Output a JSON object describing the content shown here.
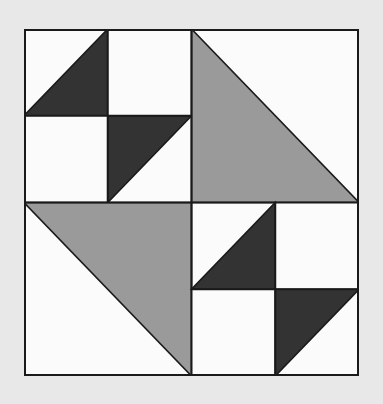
{
  "figure": {
    "kind": "quilt-block-pattern",
    "canvas": {
      "width": 383,
      "height": 404
    },
    "background_color": "#e8e8e8",
    "block": {
      "x": 24,
      "y": 29,
      "width": 335,
      "height": 347,
      "outline_color": "#1a1a1a",
      "outline_width": 2
    },
    "palette": {
      "background": "#e8e8e8",
      "white": "#fbfbfb",
      "gray": "#9a9a9a",
      "dark": "#333333",
      "line": "#1a1a1a"
    },
    "grid": {
      "rows": 2,
      "cols": 2,
      "divider_color": "#1a1a1a",
      "divider_width": 2
    },
    "quadrants": [
      {
        "name": "top-left",
        "row": 0,
        "col": 0,
        "layout": "four-patch",
        "cells": [
          {
            "row": 0,
            "col": 0,
            "fill": "dark",
            "shape": "triangle-bottom-right",
            "color": "#333333"
          },
          {
            "row": 0,
            "col": 1,
            "fill": "white",
            "shape": "square",
            "color": "#fbfbfb"
          },
          {
            "row": 1,
            "col": 0,
            "fill": "white",
            "shape": "square",
            "color": "#fbfbfb"
          },
          {
            "row": 1,
            "col": 1,
            "fill": "dark",
            "shape": "triangle-top-left",
            "color": "#333333"
          }
        ]
      },
      {
        "name": "top-right",
        "row": 0,
        "col": 1,
        "layout": "half-square-triangle",
        "cells": [
          {
            "row": 0,
            "col": 0,
            "fill": "gray",
            "shape": "triangle-bottom-left",
            "color": "#9a9a9a"
          }
        ]
      },
      {
        "name": "bottom-left",
        "row": 1,
        "col": 0,
        "layout": "half-square-triangle",
        "cells": [
          {
            "row": 0,
            "col": 0,
            "fill": "gray",
            "shape": "triangle-top-right",
            "color": "#9a9a9a"
          }
        ]
      },
      {
        "name": "bottom-right",
        "row": 1,
        "col": 1,
        "layout": "four-patch",
        "cells": [
          {
            "row": 0,
            "col": 0,
            "fill": "dark",
            "shape": "triangle-bottom-right",
            "color": "#333333"
          },
          {
            "row": 0,
            "col": 1,
            "fill": "white",
            "shape": "square",
            "color": "#fbfbfb"
          },
          {
            "row": 1,
            "col": 0,
            "fill": "white",
            "shape": "square",
            "color": "#fbfbfb"
          },
          {
            "row": 1,
            "col": 1,
            "fill": "dark",
            "shape": "triangle-top-left",
            "color": "#333333"
          }
        ]
      }
    ]
  }
}
